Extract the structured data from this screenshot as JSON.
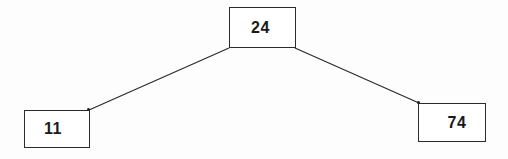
{
  "diagram": {
    "type": "binary-tree",
    "background_color": "#fdfdfd",
    "line_color": "#2b2b2b",
    "text_color": "#1a1a1a",
    "nodes": [
      {
        "id": "root",
        "label": "24",
        "role": "root-node"
      },
      {
        "id": "left",
        "label": "11",
        "role": "left-child-node"
      },
      {
        "id": "right",
        "label": "74",
        "role": "right-child-node"
      }
    ],
    "edges": [
      {
        "from": "root",
        "to": "left"
      },
      {
        "from": "root",
        "to": "right"
      }
    ]
  }
}
